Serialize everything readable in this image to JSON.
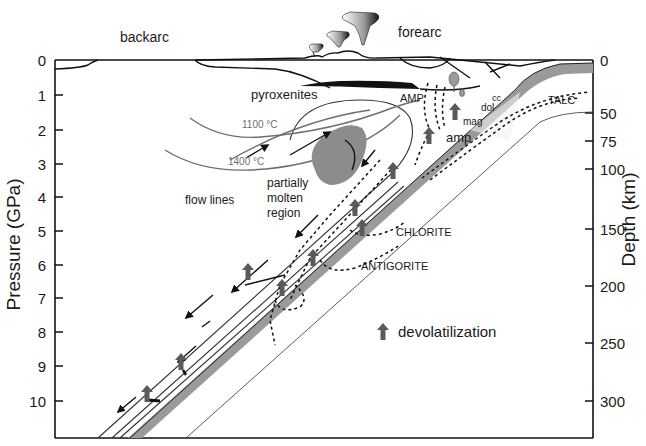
{
  "figure": {
    "type": "subduction-zone-cross-section",
    "regions": {
      "backarc": "backarc",
      "forearc": "forearc"
    },
    "left_axis": {
      "title": "Pressure (GPa)",
      "ticks": [
        "0",
        "1",
        "2",
        "3",
        "4",
        "5",
        "6",
        "7",
        "8",
        "9",
        "10"
      ]
    },
    "right_axis": {
      "title": "Depth (km)",
      "ticks": [
        "0",
        "50",
        "75",
        "100",
        "150",
        "200",
        "250",
        "300"
      ]
    },
    "labels": {
      "pyroxenites": "pyroxenites",
      "amp_upper": "AMP",
      "cc": "cc",
      "dol": "dol",
      "mag": "mag",
      "amp_lower": "amp",
      "talc": "TALC",
      "isotherm_1100": "1100 °C",
      "isotherm_1400": "1400 °C",
      "flow_lines": "flow lines",
      "partially_molten": [
        "partially",
        "molten",
        "region"
      ],
      "chlorite": "CHLORITE",
      "antigorite": "ANTIGORITE"
    },
    "legend": {
      "icon": "up-arrow-icon",
      "label": "devolatilization"
    },
    "colors": {
      "slab_band": "#9a9a9a",
      "molten_region": "#8c8c8c",
      "isotherm": "#6e6e6e",
      "arrow": "#5a5a5a",
      "ink": "#1a1a1a"
    }
  }
}
